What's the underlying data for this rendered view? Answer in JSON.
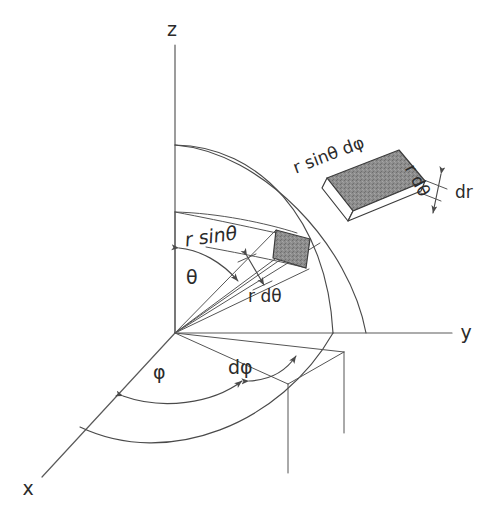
{
  "figure": {
    "background_color": "#ffffff",
    "line_color": "#4a4a4a",
    "shade_color": "#8a8a8a"
  },
  "axes": [
    {
      "name": "z-axis",
      "label": "z",
      "direction": "vertical-up",
      "label_x": 172,
      "label_y": 30
    },
    {
      "name": "y-axis",
      "label": "y",
      "direction": "horizontal-right",
      "label_x": 466,
      "label_y": 333
    },
    {
      "name": "x-axis",
      "label": "x",
      "direction": "lower-left-oblique",
      "label_x": 28,
      "label_y": 489
    }
  ],
  "angle_labels": [
    {
      "name": "theta",
      "text": "θ",
      "x": 186,
      "y": 278,
      "style": "upright"
    },
    {
      "name": "phi",
      "text": "φ",
      "x": 153,
      "y": 373,
      "style": "upright"
    },
    {
      "name": "d-phi",
      "text": "dφ",
      "x": 228,
      "y": 368,
      "style": "upright"
    }
  ],
  "length_labels": [
    {
      "name": "r-sin-theta",
      "text": "r sinθ",
      "x": 185,
      "y": 241,
      "style": "italic",
      "rotation": -8
    },
    {
      "name": "r-d-theta",
      "text": "r dθ",
      "x": 248,
      "y": 297,
      "style": "upright",
      "rotation": 0
    }
  ],
  "inset": {
    "name": "volume-element-block",
    "labels": [
      {
        "name": "inset-r-sin-theta-d-phi",
        "text": "r sinθ dφ",
        "x": 294,
        "y": 169,
        "rotation": -21
      },
      {
        "name": "inset-r-d-theta",
        "text": "r dθ",
        "x": 409,
        "y": 166,
        "rotation": 62
      },
      {
        "name": "inset-dr",
        "text": "dr",
        "x": 455,
        "y": 193,
        "rotation": 0
      }
    ]
  }
}
